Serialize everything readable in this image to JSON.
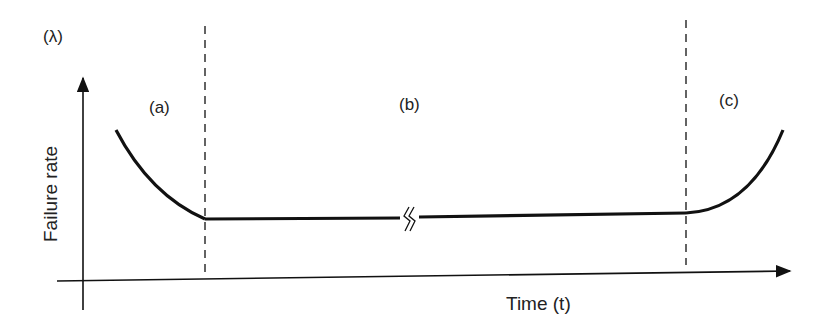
{
  "figure": {
    "lambda_label": "(λ)",
    "y_axis_label": "Failure rate",
    "x_axis_label": "Time (t)",
    "regions": [
      {
        "id": "a",
        "label": "(a)"
      },
      {
        "id": "b",
        "label": "(b)"
      },
      {
        "id": "c",
        "label": "(c)"
      }
    ],
    "break_symbol": "axis-break",
    "colors": {
      "line": "#111111",
      "background": "#ffffff"
    }
  }
}
